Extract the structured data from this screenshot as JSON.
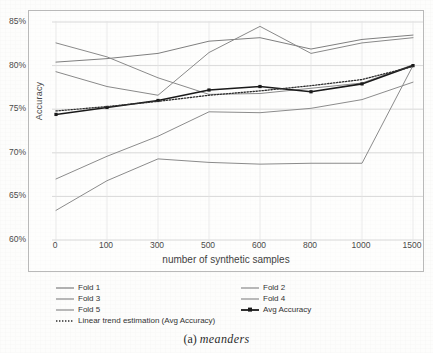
{
  "figure": {
    "caption_label": "(a)",
    "caption_text": "meanders"
  },
  "chart_data": {
    "type": "line",
    "title": "",
    "xlabel": "number of synthetic samples",
    "ylabel": "Accuracy",
    "categories": [
      "0",
      "100",
      "300",
      "500",
      "600",
      "800",
      "1000",
      "1500"
    ],
    "x_tick_labels": [
      "0",
      "100",
      "300",
      "500",
      "600",
      "800",
      "1000",
      "1500"
    ],
    "y_tick_labels": [
      "60%",
      "65%",
      "70%",
      "75%",
      "80%",
      "85%"
    ],
    "y_tick_values": [
      60,
      65,
      70,
      75,
      80,
      85
    ],
    "ylim": [
      60,
      85
    ],
    "grid": true,
    "legend_position": "below-axes",
    "series": [
      {
        "name": "Fold 1",
        "color": "#7f7f7f",
        "style": "solid",
        "values": [
          80.4,
          80.8,
          81.4,
          82.8,
          83.2,
          81.9,
          83.0,
          83.5
        ]
      },
      {
        "name": "Fold 2",
        "color": "#8a8a8a",
        "style": "solid",
        "values": [
          82.6,
          81.0,
          78.6,
          76.7,
          76.8,
          77.4,
          78.0,
          80.1
        ]
      },
      {
        "name": "Fold 3",
        "color": "#898989",
        "style": "solid",
        "values": [
          79.3,
          77.6,
          76.6,
          81.5,
          84.5,
          81.4,
          82.6,
          83.2
        ]
      },
      {
        "name": "Fold 4",
        "color": "#8c8c8c",
        "style": "solid",
        "values": [
          67.0,
          69.6,
          71.9,
          74.7,
          74.6,
          75.1,
          76.1,
          78.1
        ]
      },
      {
        "name": "Fold 5",
        "color": "#8b8b8b",
        "style": "solid",
        "values": [
          63.4,
          66.8,
          69.3,
          68.9,
          68.7,
          68.8,
          68.8,
          80.0
        ]
      },
      {
        "name": "Avg Accuracy",
        "color": "#1a1a1a",
        "style": "solid-marker",
        "values": [
          74.4,
          75.2,
          76.0,
          77.2,
          77.6,
          77.0,
          77.9,
          80.0
        ]
      },
      {
        "name": "Linear trend estimation (Avg Accuracy)",
        "color": "#2e2e2e",
        "style": "dotted",
        "values": [
          74.8,
          75.3,
          75.9,
          76.6,
          77.1,
          77.7,
          78.4,
          79.9
        ]
      }
    ]
  },
  "legend": {
    "column_left": [
      "Fold 1",
      "Fold 3",
      "Fold 5",
      "Linear trend estimation (Avg Accuracy)"
    ],
    "column_right": [
      "Fold 2",
      "Fold 4",
      "Avg Accuracy"
    ]
  }
}
